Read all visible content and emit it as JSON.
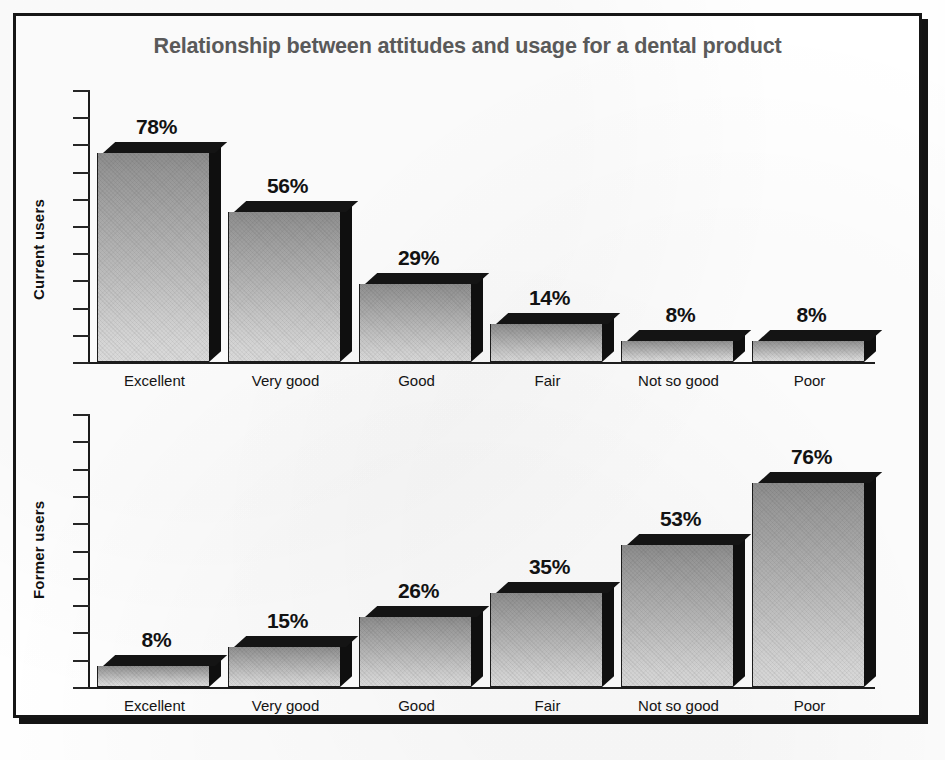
{
  "figure": {
    "title": "Relationship between attitudes and usage for a dental product",
    "frame_color": "#161616",
    "title_color": "#5b5b5b",
    "bar_fill_top": "#8f8f8f",
    "bar_fill_bottom": "#dedede",
    "bar_edge_color": "#0f0f0f"
  },
  "chart_data": [
    {
      "type": "bar",
      "title": "Relationship between attitudes and usage for a dental product",
      "panel_label": "Current users",
      "ylabel": "Current users",
      "xlabel": "",
      "categories": [
        "Excellent",
        "Very good",
        "Good",
        "Fair",
        "Not so good",
        "Poor"
      ],
      "values": [
        78,
        56,
        29,
        14,
        8,
        8
      ],
      "value_labels": [
        "78%",
        "56%",
        "29%",
        "14%",
        "8%",
        "8%"
      ],
      "ylim": [
        0,
        100
      ],
      "y_tick_labels": [],
      "y_tick_count": 10,
      "grid": false,
      "legend": false,
      "units": "percent"
    },
    {
      "type": "bar",
      "title": "Relationship between attitudes and usage for a dental product",
      "panel_label": "Former users",
      "ylabel": "Former users",
      "xlabel": "",
      "categories": [
        "Excellent",
        "Very good",
        "Good",
        "Fair",
        "Not so good",
        "Poor"
      ],
      "values": [
        8,
        15,
        26,
        35,
        53,
        76
      ],
      "value_labels": [
        "8%",
        "15%",
        "26%",
        "35%",
        "53%",
        "76%"
      ],
      "ylim": [
        0,
        100
      ],
      "y_tick_labels": [],
      "y_tick_count": 10,
      "grid": false,
      "legend": false,
      "units": "percent"
    }
  ]
}
